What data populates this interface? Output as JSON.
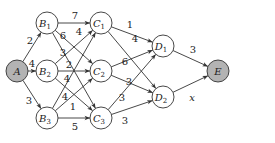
{
  "diagram": {
    "type": "directed-network",
    "colors": {
      "stroke": "#333333",
      "shaded_fill": "#b3b3b3",
      "plain_fill": "#ffffff",
      "text": "#222222"
    },
    "nodes": [
      {
        "id": "A",
        "letter": "A",
        "sub": "",
        "x": 17,
        "y": 71,
        "shaded": true
      },
      {
        "id": "B1",
        "letter": "B",
        "sub": "1",
        "x": 47,
        "y": 23,
        "shaded": false
      },
      {
        "id": "B2",
        "letter": "B",
        "sub": "2",
        "x": 47,
        "y": 71,
        "shaded": false
      },
      {
        "id": "B3",
        "letter": "B",
        "sub": "3",
        "x": 47,
        "y": 118,
        "shaded": false
      },
      {
        "id": "C1",
        "letter": "C",
        "sub": "1",
        "x": 101,
        "y": 23,
        "shaded": false
      },
      {
        "id": "C2",
        "letter": "C",
        "sub": "2",
        "x": 101,
        "y": 71,
        "shaded": false
      },
      {
        "id": "C3",
        "letter": "C",
        "sub": "3",
        "x": 101,
        "y": 118,
        "shaded": false
      },
      {
        "id": "D1",
        "letter": "D",
        "sub": "1",
        "x": 163,
        "y": 46,
        "shaded": false
      },
      {
        "id": "D2",
        "letter": "D",
        "sub": "2",
        "x": 163,
        "y": 97,
        "shaded": false
      },
      {
        "id": "E",
        "letter": "E",
        "sub": "",
        "x": 218,
        "y": 71,
        "shaded": true
      }
    ],
    "edges": [
      {
        "from": "A",
        "to": "B1",
        "label": "2",
        "lx": 30,
        "ly": 44
      },
      {
        "from": "A",
        "to": "B2",
        "label": "4",
        "lx": 32,
        "ly": 67
      },
      {
        "from": "A",
        "to": "B3",
        "label": "3",
        "lx": 29,
        "ly": 104
      },
      {
        "from": "B1",
        "to": "C1",
        "label": "7",
        "lx": 75,
        "ly": 19
      },
      {
        "from": "B1",
        "to": "C2",
        "label": "4",
        "lx": 79,
        "ly": 35
      },
      {
        "from": "B1",
        "to": "C3",
        "label": "6",
        "lx": 63,
        "ly": 39
      },
      {
        "from": "B2",
        "to": "C1",
        "label": "3",
        "lx": 63,
        "ly": 56
      },
      {
        "from": "B2",
        "to": "C2",
        "label": "2",
        "lx": 69,
        "ly": 68
      },
      {
        "from": "B2",
        "to": "C3",
        "label": "4",
        "lx": 67,
        "ly": 82
      },
      {
        "from": "B3",
        "to": "C1",
        "label": "4",
        "lx": 65,
        "ly": 100
      },
      {
        "from": "B3",
        "to": "C2",
        "label": "1",
        "lx": 73,
        "ly": 110
      },
      {
        "from": "B3",
        "to": "C3",
        "label": "5",
        "lx": 75,
        "ly": 130
      },
      {
        "from": "C1",
        "to": "D1",
        "label": "1",
        "lx": 130,
        "ly": 28
      },
      {
        "from": "C1",
        "to": "D2",
        "label": "4",
        "lx": 135,
        "ly": 42
      },
      {
        "from": "C2",
        "to": "D1",
        "label": "6",
        "lx": 125,
        "ly": 65
      },
      {
        "from": "C2",
        "to": "D2",
        "label": "3",
        "lx": 129,
        "ly": 85
      },
      {
        "from": "C3",
        "to": "D1",
        "label": "3",
        "lx": 122,
        "ly": 101
      },
      {
        "from": "C3",
        "to": "D2",
        "label": "3",
        "lx": 125,
        "ly": 124
      },
      {
        "from": "D1",
        "to": "E",
        "label": "3",
        "lx": 193,
        "ly": 53
      },
      {
        "from": "D2",
        "to": "E",
        "label": "x",
        "lx": 192,
        "ly": 101,
        "italic": true
      }
    ]
  }
}
